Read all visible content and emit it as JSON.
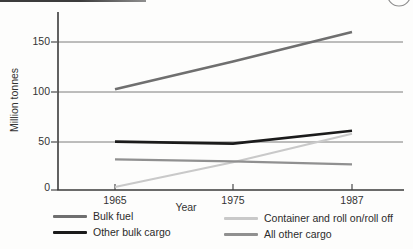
{
  "chart_data": {
    "type": "line",
    "title": "",
    "xlabel": "Year",
    "ylabel": "Million tonnes",
    "categories": [
      1965,
      1975,
      1987
    ],
    "x_ticks": [
      "1965",
      "1975",
      "1987"
    ],
    "y_tick_labels": [
      "150",
      "100",
      "50",
      "0"
    ],
    "ylim": [
      0,
      178
    ],
    "grid": "horizontal",
    "legend_position": "bottom-two-columns",
    "series": [
      {
        "name": "Bulk fuel",
        "values": [
          102,
          130,
          160
        ],
        "color": "#6f6f6f",
        "width": 2.6
      },
      {
        "name": "Other bulk cargo",
        "values": [
          49,
          47,
          60
        ],
        "color": "#1b1b1b",
        "width": 2.6
      },
      {
        "name": "Container and roll on/roll off",
        "values": [
          3,
          28,
          57
        ],
        "color": "#c9c9c9",
        "width": 2.2
      },
      {
        "name": "All other cargo",
        "values": [
          31,
          29,
          26
        ],
        "color": "#909090",
        "width": 2.2
      }
    ]
  },
  "decorations": {
    "axis_color": "#3a3a3a",
    "grid_color": "#6e6e6e",
    "page_circle_color": "#8d8d8d"
  }
}
